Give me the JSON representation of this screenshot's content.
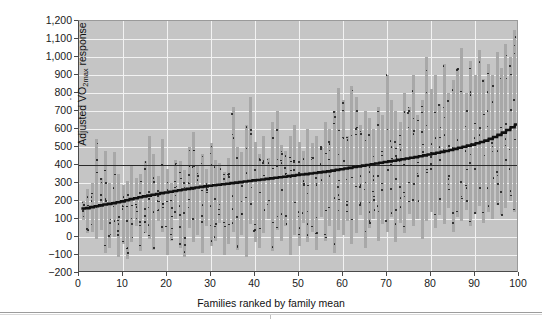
{
  "figure": {
    "background_color": "#ffffff",
    "plot_background_color": "#c5c5c5",
    "gridline_color": "#f2f2f2",
    "bar_color": "#a8a8a8",
    "dot_color": "#1c1c1c",
    "mean_line_color": "#101010",
    "reference_line_color": "#2a2a2a"
  },
  "chart_data": {
    "type": "bar",
    "title": "",
    "subtitle": "",
    "xlabel": "Families ranked by family mean",
    "ylabel": "Adjusted VO2max response",
    "ylabel_parts": {
      "prefix": "Adjusted ",
      "v_with_dot": "V",
      "o": "O",
      "subscript": "2max",
      "suffix": " response"
    },
    "xlim": [
      0,
      100
    ],
    "ylim": [
      -200,
      1200
    ],
    "grid": true,
    "legend": null,
    "xticks": [
      0,
      10,
      20,
      30,
      40,
      50,
      60,
      70,
      80,
      90,
      100
    ],
    "xtick_labels": [
      "0",
      "10",
      "20",
      "30",
      "40",
      "50",
      "60",
      "70",
      "80",
      "90",
      "100"
    ],
    "yticks": [
      -200,
      -100,
      0,
      100,
      200,
      300,
      400,
      500,
      600,
      700,
      800,
      900,
      1000,
      1100,
      1200
    ],
    "ytick_labels": [
      "−200",
      "−100",
      "0",
      "100",
      "200",
      "300",
      "400",
      "500",
      "600",
      "700",
      "800",
      "900",
      "1,000",
      "1,100",
      "1,200"
    ],
    "reference_line": {
      "y": 400,
      "label": "overall mean"
    },
    "series_description": "Each vertical bar spans the range of adjusted VO2max responses within one family; dots are individual members; the heavy stepped line is the family mean, ranked ascending.",
    "n_families": 100,
    "family_means": [
      150,
      152,
      158,
      163,
      168,
      172,
      176,
      180,
      185,
      190,
      196,
      202,
      208,
      213,
      218,
      222,
      227,
      231,
      236,
      240,
      244,
      248,
      252,
      256,
      260,
      264,
      268,
      271,
      274,
      277,
      280,
      283,
      286,
      289,
      292,
      295,
      298,
      301,
      304,
      307,
      310,
      313,
      316,
      319,
      322,
      325,
      328,
      331,
      334,
      337,
      340,
      343,
      346,
      349,
      352,
      355,
      358,
      362,
      366,
      370,
      374,
      378,
      382,
      386,
      390,
      394,
      398,
      402,
      406,
      410,
      414,
      418,
      422,
      426,
      430,
      434,
      438,
      442,
      447,
      452,
      457,
      462,
      467,
      472,
      478,
      484,
      490,
      496,
      502,
      508,
      515,
      522,
      530,
      540,
      550,
      562,
      575,
      590,
      605,
      620
    ],
    "family_ranges": [
      [
        95,
        200
      ],
      [
        20,
        265
      ],
      [
        30,
        300
      ],
      [
        -10,
        545
      ],
      [
        40,
        330
      ],
      [
        -90,
        480
      ],
      [
        -60,
        300
      ],
      [
        0,
        470
      ],
      [
        -110,
        350
      ],
      [
        -40,
        290
      ],
      [
        -120,
        310
      ],
      [
        -30,
        400
      ],
      [
        60,
        330
      ],
      [
        -80,
        350
      ],
      [
        20,
        420
      ],
      [
        -10,
        560
      ],
      [
        -70,
        460
      ],
      [
        90,
        340
      ],
      [
        30,
        545
      ],
      [
        -100,
        380
      ],
      [
        -20,
        300
      ],
      [
        100,
        430
      ],
      [
        -60,
        420
      ],
      [
        -110,
        370
      ],
      [
        50,
        500
      ],
      [
        -30,
        585
      ],
      [
        10,
        400
      ],
      [
        -90,
        460
      ],
      [
        60,
        380
      ],
      [
        -50,
        520
      ],
      [
        -20,
        430
      ],
      [
        80,
        410
      ],
      [
        -100,
        360
      ],
      [
        -40,
        440
      ],
      [
        30,
        720
      ],
      [
        -70,
        500
      ],
      [
        10,
        470
      ],
      [
        -110,
        620
      ],
      [
        70,
        780
      ],
      [
        -30,
        530
      ],
      [
        -60,
        460
      ],
      [
        20,
        560
      ],
      [
        100,
        440
      ],
      [
        -80,
        640
      ],
      [
        40,
        700
      ],
      [
        -20,
        510
      ],
      [
        60,
        480
      ],
      [
        -100,
        560
      ],
      [
        10,
        620
      ],
      [
        -50,
        530
      ],
      [
        80,
        480
      ],
      [
        -30,
        600
      ],
      [
        30,
        520
      ],
      [
        -70,
        560
      ],
      [
        110,
        500
      ],
      [
        -20,
        640
      ],
      [
        60,
        600
      ],
      [
        -90,
        700
      ],
      [
        40,
        830
      ],
      [
        10,
        760
      ],
      [
        90,
        560
      ],
      [
        -40,
        840
      ],
      [
        20,
        780
      ],
      [
        120,
        620
      ],
      [
        -60,
        700
      ],
      [
        50,
        660
      ],
      [
        100,
        600
      ],
      [
        -20,
        720
      ],
      [
        70,
        680
      ],
      [
        30,
        900
      ],
      [
        110,
        760
      ],
      [
        -30,
        700
      ],
      [
        80,
        640
      ],
      [
        20,
        800
      ],
      [
        130,
        720
      ],
      [
        60,
        900
      ],
      [
        100,
        680
      ],
      [
        -10,
        760
      ],
      [
        90,
        1000
      ],
      [
        140,
        820
      ],
      [
        50,
        900
      ],
      [
        120,
        740
      ],
      [
        70,
        960
      ],
      [
        160,
        800
      ],
      [
        30,
        870
      ],
      [
        110,
        940
      ],
      [
        90,
        1050
      ],
      [
        150,
        800
      ],
      [
        60,
        980
      ],
      [
        130,
        900
      ],
      [
        170,
        1040
      ],
      [
        80,
        880
      ],
      [
        140,
        960
      ],
      [
        100,
        900
      ],
      [
        180,
        1030
      ],
      [
        120,
        940
      ],
      [
        160,
        1070
      ],
      [
        200,
        1000
      ],
      [
        140,
        1150
      ],
      [
        210,
        1120
      ]
    ]
  }
}
